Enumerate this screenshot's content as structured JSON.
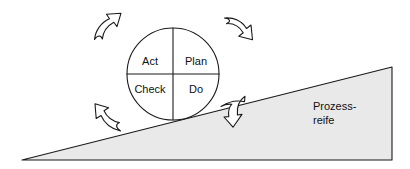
{
  "diagram": {
    "colors": {
      "ramp_fill": "#e9e9e9",
      "ramp_stroke": "#1a1a1a",
      "circle_fill": "#ffffff",
      "circle_stroke": "#1a1a1a",
      "arrow_fill": "#ffffff",
      "arrow_stroke": "#1a1a1a",
      "text": "#111111",
      "background": "#ffffff"
    },
    "cycle": {
      "name": "pdca-wheel",
      "quadrants": [
        {
          "id": "act",
          "label": "Act",
          "position": "top-left"
        },
        {
          "id": "plan",
          "label": "Plan",
          "position": "top-right"
        },
        {
          "id": "check",
          "label": "Check",
          "position": "bottom-left"
        },
        {
          "id": "do",
          "label": "Do",
          "position": "bottom-right"
        }
      ]
    },
    "ramp": {
      "name": "prozessreife-ramp",
      "label_line1": "Prozess-",
      "label_line2": "reife"
    },
    "arrows": [
      {
        "id": "arrow-top-left",
        "direction": "up-right",
        "role": "rotation"
      },
      {
        "id": "arrow-top-right",
        "direction": "down-right",
        "role": "rotation"
      },
      {
        "id": "arrow-bottom-left",
        "direction": "up-left",
        "role": "rotation"
      },
      {
        "id": "arrow-chock",
        "direction": "down",
        "role": "chock"
      }
    ]
  }
}
